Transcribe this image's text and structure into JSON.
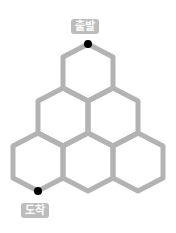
{
  "labels": {
    "start": "출발",
    "end": "도착"
  },
  "colors": {
    "edge": "#b3b3b3",
    "point": "#000000",
    "label_bg": "#bdbdbd",
    "label_text": "#ffffff"
  },
  "grid": {
    "rows": [
      1,
      2,
      3
    ],
    "total_hexagons": 6
  }
}
